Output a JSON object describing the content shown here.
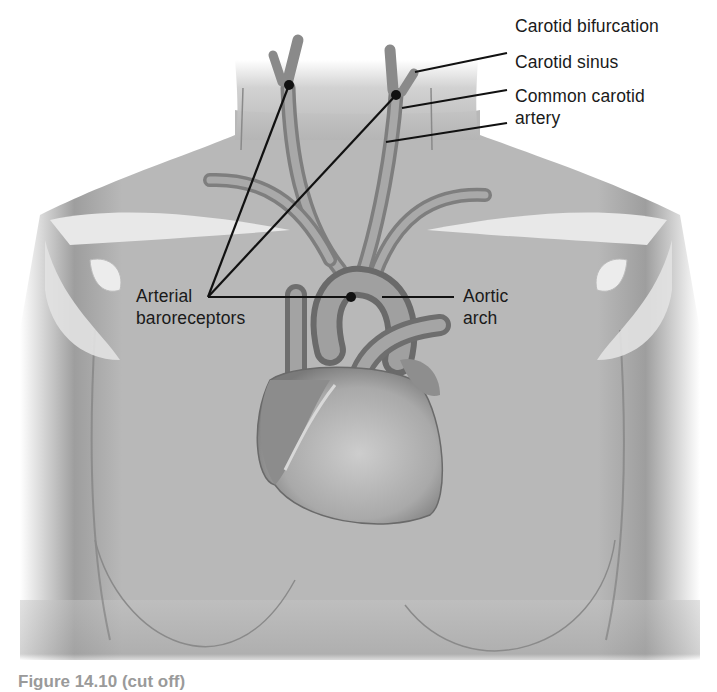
{
  "figure": {
    "labels": {
      "carotid_bifurcation": "Carotid bifurcation",
      "carotid_sinus": "Carotid sinus",
      "common_carotid_line1": "Common carotid",
      "common_carotid_line2": "artery",
      "arterial_line1": "Arterial",
      "arterial_line2": "baroreceptors",
      "aortic_line1": "Aortic",
      "aortic_line2": "arch"
    },
    "caption_fragment": "Figure 14.10 (cut off)",
    "colors": {
      "background": "#ffffff",
      "skin": "#b8b8b8",
      "skin_dark": "#8f8f8f",
      "vessel": "#9a9a9a",
      "vessel_dark": "#6e6e6e",
      "heart": "#a8a8a8",
      "bone": "#e6e6e6",
      "leader_line": "#111111",
      "text": "#1a1a1a"
    }
  }
}
